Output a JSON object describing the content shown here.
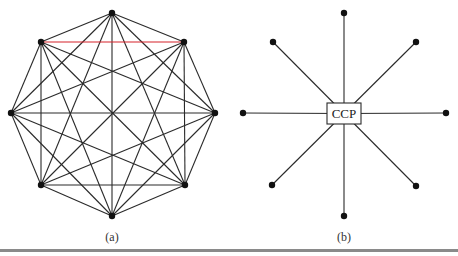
{
  "figure_a": {
    "caption": "(a)",
    "topology": "fully-connected mesh",
    "nodes": [
      "n0-top",
      "n1-top-right",
      "n2-right",
      "n3-bottom-right",
      "n4-bottom",
      "n5-bottom-left",
      "n6-left",
      "n7-top-left"
    ],
    "highlighted_edge": [
      "n7-top-left",
      "n1-top-right"
    ],
    "highlight_color": "#d6232a",
    "edge_color": "#2a2a2a"
  },
  "figure_b": {
    "caption": "(b)",
    "topology": "star",
    "center_label": "CCP",
    "nodes": [
      "top",
      "top-right",
      "right",
      "bottom-right",
      "bottom",
      "bottom-left",
      "left",
      "top-left"
    ]
  }
}
